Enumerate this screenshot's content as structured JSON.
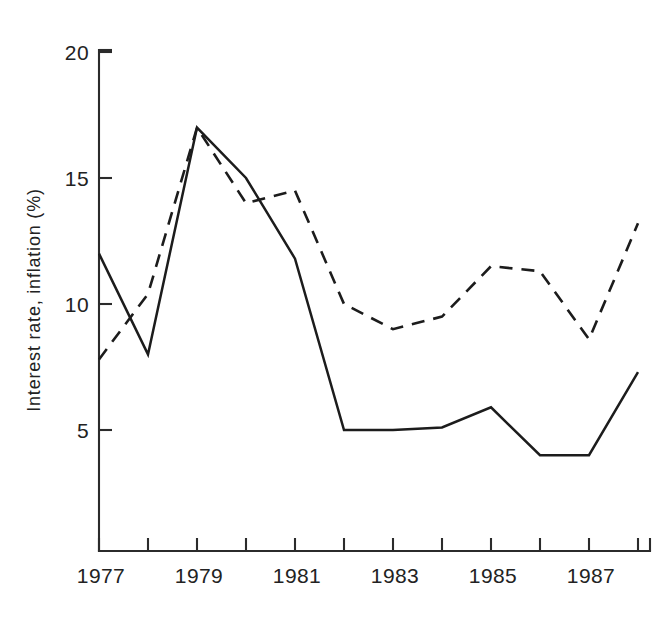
{
  "chart_data": {
    "type": "line",
    "title": "",
    "xlabel": "",
    "ylabel": "Interest rate, inflation (%)",
    "x": [
      1977,
      1978,
      1979,
      1980,
      1981,
      1982,
      1983,
      1984,
      1985,
      1986,
      1987,
      1988
    ],
    "xlim": [
      1977,
      1988
    ],
    "ylim": [
      0,
      20
    ],
    "xticks": [
      1977,
      1978,
      1979,
      1980,
      1981,
      1982,
      1983,
      1984,
      1985,
      1986,
      1987,
      1988
    ],
    "xticklabels": [
      "1977",
      "",
      "1979",
      "",
      "1981",
      "",
      "1983",
      "",
      "1985",
      "",
      "1987",
      ""
    ],
    "yticks": [
      5,
      10,
      15,
      20
    ],
    "yticklabels": [
      "5",
      "10",
      "15",
      "20"
    ],
    "grid": false,
    "legend": "none",
    "series": [
      {
        "name": "interest-rate-solid",
        "style": "solid",
        "values": [
          12.0,
          8.0,
          17.0,
          15.0,
          11.8,
          5.0,
          5.0,
          5.1,
          5.9,
          4.0,
          4.0,
          7.3
        ]
      },
      {
        "name": "inflation-dashed",
        "style": "dashed",
        "values": [
          7.8,
          10.4,
          17.0,
          14.0,
          14.5,
          10.0,
          9.0,
          9.5,
          11.5,
          11.3,
          8.6,
          13.2
        ]
      }
    ]
  },
  "axes": {
    "y_axis_title": "Interest rate, inflation (%)",
    "y_tick_labels": [
      "20",
      "15",
      "10",
      "5"
    ],
    "x_tick_labels": [
      "1977",
      "1979",
      "1981",
      "1983",
      "1985",
      "1987"
    ]
  }
}
